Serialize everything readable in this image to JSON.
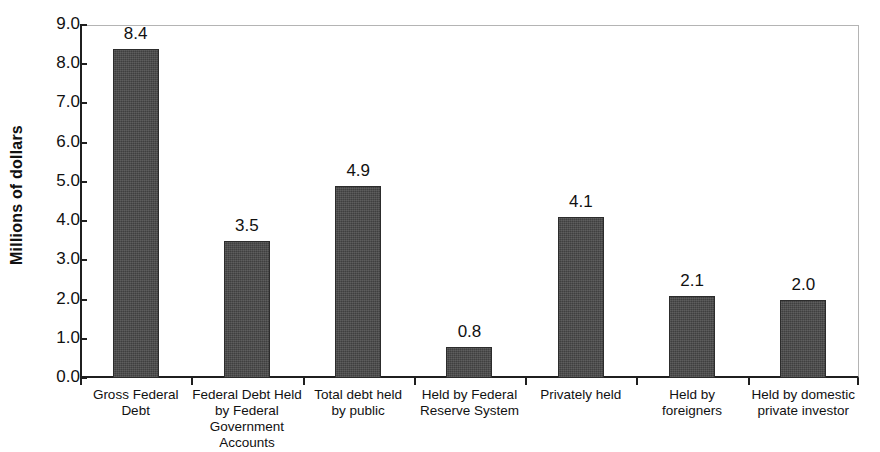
{
  "chart_data": {
    "type": "bar",
    "title": "",
    "subtitle": "",
    "xlabel": "",
    "ylabel": "Millions of dollars",
    "ylim": [
      0.0,
      9.0
    ],
    "ytick_step": 1.0,
    "ytick_labels": [
      "9.0",
      "8.0",
      "7.0",
      "6.0",
      "5.0",
      "4.0",
      "3.0",
      "2.0",
      "1.0",
      "0.0"
    ],
    "grid": false,
    "legend": null,
    "bar_color": "#474747",
    "axis_color": "#1f1f1f",
    "frame_color": "#b4b4b4",
    "categories": [
      "Gross Federal Debt",
      "Federal Debt Held by Federal Government Accounts",
      "Total debt held by public",
      "Held by Federal Reserve System",
      "Privately held",
      "Held by foreigners",
      "Held by domestic private investor"
    ],
    "category_lines": [
      [
        "Gross Federal",
        "Debt"
      ],
      [
        "Federal Debt Held",
        "by Federal",
        "Government",
        "Accounts"
      ],
      [
        "Total debt held",
        "by public"
      ],
      [
        "Held by Federal",
        "Reserve System"
      ],
      [
        "Privately held"
      ],
      [
        "Held by",
        "foreigners"
      ],
      [
        "Held by domestic",
        "private investor"
      ]
    ],
    "values": [
      8.4,
      3.5,
      4.9,
      0.8,
      4.1,
      2.1,
      2.0
    ],
    "value_labels": [
      "8.4",
      "3.5",
      "4.9",
      "0.8",
      "4.1",
      "2.1",
      "2.0"
    ]
  }
}
